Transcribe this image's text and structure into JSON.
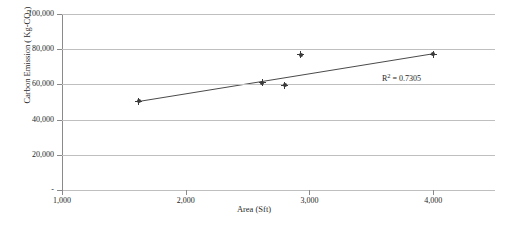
{
  "chart_data": {
    "type": "scatter",
    "title": "",
    "xlabel": "Area (Sft)",
    "ylabel": "Carbon Emission ( Kg-CO2)",
    "ylabel_parts": {
      "prefix": "Carbon Emission ( Kg-CO",
      "sub": "2",
      "suffix": ")"
    },
    "xlim": [
      1000,
      4500
    ],
    "ylim": [
      0,
      100000
    ],
    "grid": "horizontal",
    "legend": "none",
    "xticks": [
      1000,
      2000,
      3000,
      4000
    ],
    "xtick_labels": [
      "1,000",
      "2,000",
      "3,000",
      "4,000"
    ],
    "yticks": [
      0,
      20000,
      40000,
      60000,
      80000,
      100000
    ],
    "ytick_labels": [
      "-",
      "20,000",
      "40,000",
      "60,000",
      "80,000",
      "100,000"
    ],
    "points": [
      {
        "x": 1620,
        "y": 50500
      },
      {
        "x": 2620,
        "y": 60800
      },
      {
        "x": 2800,
        "y": 59500
      },
      {
        "x": 2930,
        "y": 76800
      },
      {
        "x": 4000,
        "y": 77000
      }
    ],
    "trendline": {
      "type": "linear",
      "x_start": 1620,
      "y_start": 50300,
      "x_end": 4000,
      "y_end": 77400
    },
    "annotations": [
      {
        "name": "r-squared",
        "text_prefix": "R",
        "text_sup": "2",
        "text_suffix": " = 0.7305",
        "full_text": "R² = 0.7305"
      }
    ],
    "colors": {
      "marker": "#3a3a3a",
      "trendline": "#4a4a4a",
      "gridline": "#bfbfbf",
      "axis": "#8a8a8a",
      "text": "#1f1f1f",
      "background": "#ffffff"
    }
  }
}
